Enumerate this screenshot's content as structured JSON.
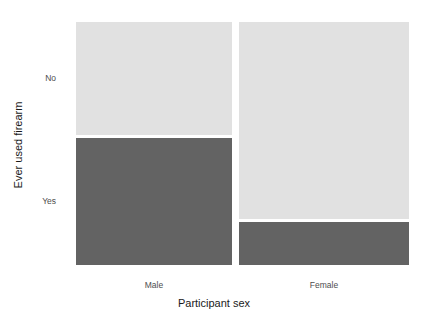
{
  "chart_data": {
    "type": "mosaic",
    "title": "",
    "subtitle": "",
    "xlabel": "Participant sex",
    "ylabel": "Ever used firearm",
    "x_categories": [
      "Male",
      "Female"
    ],
    "y_categories": [
      "No",
      "Yes"
    ],
    "grid": false,
    "legend": "none",
    "colors": {
      "no": "#e1e1e1",
      "yes": "#636363",
      "tick_text": "#4d4d4d",
      "axis_title_text": "#1a1a1a",
      "background": "#ffffff"
    },
    "column_widths_fraction": [
      0.48,
      0.52
    ],
    "columns": [
      {
        "name": "Male",
        "width_fraction": 0.48,
        "segments": [
          {
            "label": "No",
            "fraction": 0.47,
            "color": "#e1e1e1"
          },
          {
            "label": "Yes",
            "fraction": 0.53,
            "color": "#636363"
          }
        ]
      },
      {
        "name": "Female",
        "width_fraction": 0.52,
        "segments": [
          {
            "label": "No",
            "fraction": 0.82,
            "color": "#e1e1e1"
          },
          {
            "label": "Yes",
            "fraction": 0.18,
            "color": "#636363"
          }
        ]
      }
    ],
    "series": [
      {
        "name": "No",
        "categories": [
          "Male",
          "Female"
        ],
        "values": [
          0.47,
          0.82
        ]
      },
      {
        "name": "Yes",
        "categories": [
          "Male",
          "Female"
        ],
        "values": [
          0.53,
          0.18
        ]
      }
    ],
    "ylim": [
      0,
      1
    ],
    "xlim": [
      0,
      1
    ]
  },
  "axes": {
    "x_title": "Participant sex",
    "y_title": "Ever used firearm",
    "x_ticks": [
      {
        "label": "Male"
      },
      {
        "label": "Female"
      }
    ],
    "y_ticks": [
      {
        "label": "No"
      },
      {
        "label": "Yes"
      }
    ]
  }
}
